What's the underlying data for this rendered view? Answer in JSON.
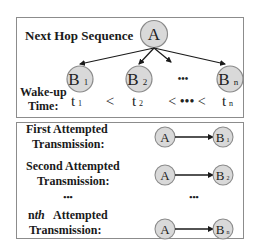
{
  "top_panel": {
    "title": "Next Hop Sequence",
    "source_node": "A",
    "targets": [
      {
        "label": "B",
        "sub": "1"
      },
      {
        "label": "B",
        "sub": "2"
      },
      {
        "label": "•••",
        "sub": ""
      },
      {
        "label": "B",
        "sub": "n"
      }
    ],
    "wakeup_label_line1": "Wake-up",
    "wakeup_label_line2": "Time:",
    "times": [
      {
        "label": "t",
        "sub": "1"
      },
      {
        "label": "<"
      },
      {
        "label": "t",
        "sub": "2"
      },
      {
        "label": "< ••• <"
      },
      {
        "label": "t",
        "sub": "n"
      }
    ]
  },
  "bottom_panel": {
    "rows": [
      {
        "line1": "First Attempted",
        "line2": "Transmission:",
        "from": "A",
        "to": "B",
        "to_sub": "1"
      },
      {
        "line1": "Second Attempted",
        "line2": "Transmission:",
        "from": "A",
        "to": "B",
        "to_sub": "2"
      },
      {
        "line1": "n",
        "line1_italic": "th",
        "line1_rest": "  Attempted",
        "line2": "Transmission:",
        "from": "A",
        "to": "B",
        "to_sub": "n"
      }
    ],
    "ellipsis_left": "•••",
    "ellipsis_right": "•••"
  },
  "colors": {
    "node_fill": "#d9d9d9",
    "node_stroke": "#8a8a8a",
    "border": "#8c8c8c",
    "arrow": "#1a1a1a"
  }
}
